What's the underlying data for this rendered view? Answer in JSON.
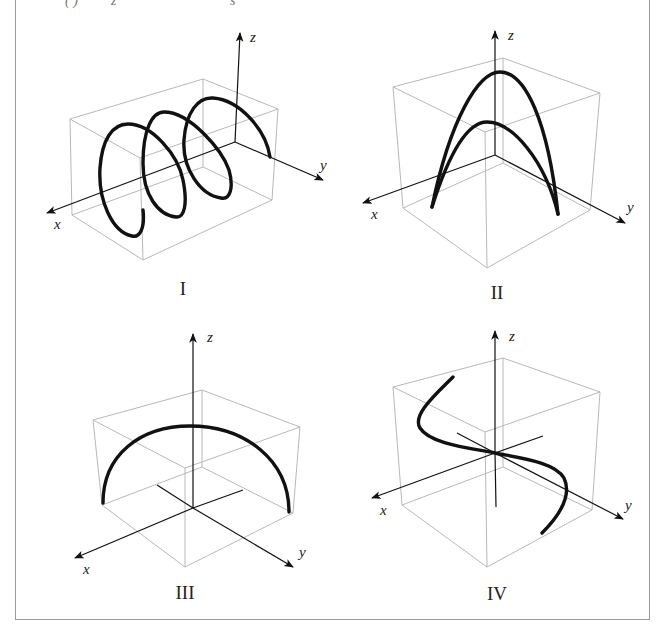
{
  "header_fragment": {
    "text_left": "( )",
    "text_mid": "z",
    "text_right": "s"
  },
  "panels": [
    {
      "id": "I",
      "label": "I",
      "curve": "helix around x-axis",
      "axes": {
        "x": "x",
        "y": "y",
        "z": "z"
      }
    },
    {
      "id": "II",
      "label": "II",
      "curve": "two parabolic arches",
      "axes": {
        "x": "x",
        "y": "y",
        "z": "z"
      }
    },
    {
      "id": "III",
      "label": "III",
      "curve": "semicircular arc",
      "axes": {
        "x": "x",
        "y": "y",
        "z": "z"
      }
    },
    {
      "id": "IV",
      "label": "IV",
      "curve": "S-shaped cubic curve",
      "axes": {
        "x": "x",
        "y": "y",
        "z": "z"
      }
    }
  ],
  "colors": {
    "curve": "#111111",
    "axis": "#111111",
    "box": "#b8b8b8",
    "frame": "#9a9a9a"
  }
}
